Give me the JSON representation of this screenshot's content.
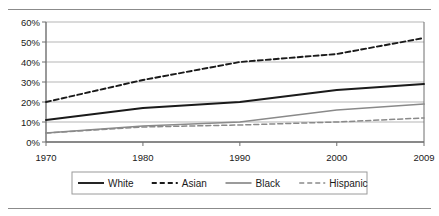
{
  "chart_data": {
    "type": "line",
    "title": "",
    "subtitle": "",
    "xlabel": "",
    "ylabel": "",
    "x": [
      1970,
      1980,
      1990,
      2000,
      2009
    ],
    "categories": [
      "1970",
      "1980",
      "1990",
      "2000",
      "2009"
    ],
    "xtick_labels": [
      "1970",
      "1980",
      "1990",
      "2000",
      "2009"
    ],
    "ytick_labels": [
      "0%",
      "10%",
      "20%",
      "30%",
      "40%",
      "50%",
      "60%"
    ],
    "ytick_values": [
      0,
      10,
      20,
      30,
      40,
      50,
      60
    ],
    "xlim": [
      1970,
      2009
    ],
    "ylim": [
      0,
      60
    ],
    "grid": "horizontal",
    "legend_position": "bottom",
    "series": [
      {
        "name": "White",
        "values": [
          11,
          17,
          20,
          26,
          29
        ],
        "color": "#1a1a1a",
        "style": "solid",
        "width": 1.9
      },
      {
        "name": "Asian",
        "values": [
          20,
          31,
          40,
          44,
          52
        ],
        "color": "#1a1a1a",
        "style": "dashed",
        "width": 1.9
      },
      {
        "name": "Black",
        "values": [
          4.5,
          8,
          10,
          16,
          19
        ],
        "color": "#8a8a8a",
        "style": "solid",
        "width": 1.7
      },
      {
        "name": "Hispanic",
        "values": [
          4.5,
          7.5,
          8.5,
          10,
          12
        ],
        "color": "#8a8a8a",
        "style": "dashed",
        "width": 1.5
      }
    ]
  },
  "axes": {
    "y_axis_name": "percent-axis",
    "x_axis_name": "year-axis"
  },
  "legend": {
    "items": [
      {
        "label": "White"
      },
      {
        "label": "Asian"
      },
      {
        "label": "Black"
      },
      {
        "label": "Hispanic"
      }
    ]
  },
  "colors": {
    "plot_border": "#6e6e6e",
    "gridline": "#b5b5b5",
    "axis_line": "#6e6e6e",
    "text": "#1a1a1a",
    "rule": "#8b8b8b",
    "legend_border": "#9a9a9a"
  }
}
